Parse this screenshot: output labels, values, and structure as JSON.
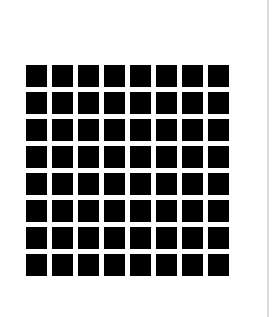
{
  "grid": {
    "rows": 8,
    "columns": 8,
    "cell_color": "#000000",
    "background_color": "#ffffff"
  }
}
